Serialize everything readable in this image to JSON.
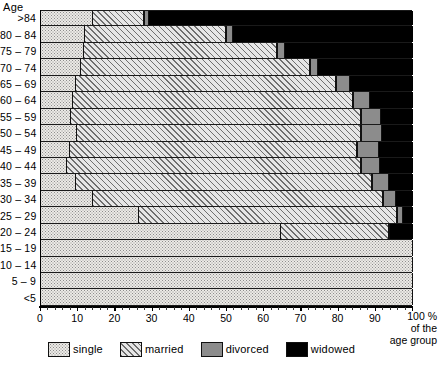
{
  "chart_data": {
    "type": "bar",
    "orientation": "horizontal",
    "stacked": "percent",
    "title": "",
    "xlabel": "100 % of the age group",
    "ylabel": "Age",
    "xlim": [
      0,
      100
    ],
    "ylim_categories": 18,
    "grid": false,
    "legend_position": "bottom",
    "xticks": [
      0,
      10,
      20,
      30,
      40,
      50,
      60,
      70,
      80,
      90,
      100
    ],
    "xticklabels": [
      "0",
      "10",
      "20",
      "30",
      "40",
      "50",
      "60",
      "70",
      "80",
      "90",
      "100 %"
    ],
    "categories": [
      ">84",
      "80 – 84",
      "75 – 79",
      "70 – 74",
      "65 – 69",
      "60 – 64",
      "55 – 59",
      "50 – 54",
      "45 – 49",
      "40 – 44",
      "35 – 39",
      "30 – 34",
      "25 – 29",
      "20 – 24",
      "15 – 19",
      "10 – 14",
      "5 – 9",
      "<5"
    ],
    "series": [
      {
        "name": "single",
        "color": "#eceae6",
        "values": [
          14.0,
          11.8,
          11.5,
          10.7,
          9.4,
          8.5,
          8.0,
          9.7,
          7.8,
          7.0,
          9.4,
          14.0,
          26.4,
          64.5,
          100.0,
          100.0,
          100.0,
          100.0
        ]
      },
      {
        "name": "married",
        "color": "#e6e6e6",
        "values": [
          13.8,
          38.0,
          52.0,
          61.5,
          70.0,
          75.5,
          78.0,
          76.3,
          77.2,
          79.0,
          79.6,
          78.0,
          69.2,
          29.0,
          0.0,
          0.0,
          0.0,
          0.0
        ]
      },
      {
        "name": "divorced",
        "color": "#8c8c8c",
        "values": [
          1.2,
          1.7,
          2.2,
          2.3,
          3.6,
          4.5,
          5.5,
          5.8,
          5.8,
          5.2,
          4.6,
          3.5,
          1.8,
          0.4,
          0.0,
          0.0,
          0.0,
          0.0
        ]
      },
      {
        "name": "widowed",
        "color": "#000000",
        "values": [
          71.0,
          48.5,
          34.3,
          25.5,
          17.0,
          11.5,
          8.5,
          8.2,
          9.2,
          8.8,
          6.4,
          4.5,
          2.6,
          6.1,
          0.0,
          0.0,
          0.0,
          0.0
        ]
      }
    ]
  },
  "axes": {
    "y_title": "Age",
    "x_unit_lines": [
      "100 %",
      "of the",
      "age group"
    ]
  },
  "legend": {
    "items": [
      {
        "label": "single",
        "icon": "swatch-dotted"
      },
      {
        "label": "married",
        "icon": "swatch-hatched"
      },
      {
        "label": "divorced",
        "icon": "swatch-gray"
      },
      {
        "label": "widowed",
        "icon": "swatch-black"
      }
    ]
  }
}
